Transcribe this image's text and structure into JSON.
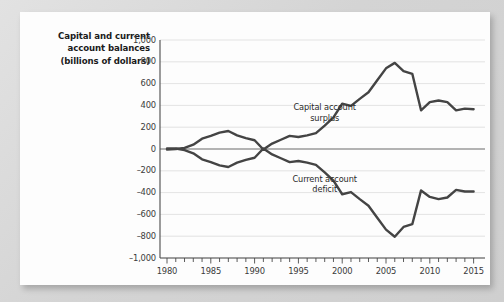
{
  "figure": {
    "axis_title": "Capital and current account balances (billions of dollars)",
    "axis_title_lines": [
      "Capital and current",
      "account balances",
      "(billions of dollars)"
    ]
  },
  "chart_data": {
    "type": "line",
    "xlabel": "",
    "ylabel": "Capital and current account balances (billions of dollars)",
    "xlim": [
      1979,
      2016
    ],
    "ylim": [
      -1000,
      1000
    ],
    "grid": true,
    "legend_position": "inline-annotations",
    "y_ticks": [
      "1,000",
      "800",
      "600",
      "400",
      "200",
      "0",
      "-200",
      "-400",
      "-600",
      "-800",
      "-1,000"
    ],
    "y_tick_values": [
      1000,
      800,
      600,
      400,
      200,
      0,
      -200,
      -400,
      -600,
      -800,
      -1000
    ],
    "x_ticks": [
      "1980",
      "1985",
      "1990",
      "1995",
      "2000",
      "2005",
      "2010",
      "2015"
    ],
    "x_tick_values": [
      1980,
      1985,
      1990,
      1995,
      2000,
      2005,
      2010,
      2015
    ],
    "x_minor_tick_interval": 1,
    "annotations": [
      {
        "text": "Capital account surplus",
        "lines": [
          "Capital account",
          "surplus"
        ],
        "x": 1998,
        "y": 330
      },
      {
        "text": "Current account deficit",
        "lines": [
          "Current account",
          "deficit"
        ],
        "x": 1998,
        "y": -330
      }
    ],
    "x": [
      1980,
      1981,
      1982,
      1983,
      1984,
      1985,
      1986,
      1987,
      1988,
      1989,
      1990,
      1991,
      1992,
      1993,
      1994,
      1995,
      1996,
      1997,
      1998,
      1999,
      2000,
      2001,
      2002,
      2003,
      2004,
      2005,
      2006,
      2007,
      2008,
      2009,
      2010,
      2011,
      2012,
      2013,
      2014,
      2015
    ],
    "series": [
      {
        "name": "Capital account surplus",
        "color": "#444444",
        "values": [
          -5,
          0,
          10,
          40,
          95,
          120,
          150,
          165,
          125,
          100,
          80,
          -5,
          50,
          85,
          120,
          110,
          125,
          145,
          215,
          290,
          415,
          395,
          460,
          520,
          630,
          740,
          790,
          715,
          690,
          355,
          430,
          445,
          430,
          355,
          370,
          365
        ]
      },
      {
        "name": "Current account deficit",
        "color": "#444444",
        "values": [
          5,
          5,
          -10,
          -40,
          -95,
          -120,
          -150,
          -165,
          -125,
          -100,
          -80,
          5,
          -50,
          -85,
          -120,
          -110,
          -125,
          -145,
          -215,
          -290,
          -415,
          -395,
          -460,
          -520,
          -630,
          -740,
          -805,
          -715,
          -690,
          -380,
          -440,
          -460,
          -445,
          -375,
          -390,
          -390
        ]
      }
    ]
  }
}
